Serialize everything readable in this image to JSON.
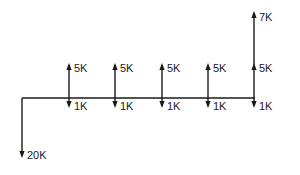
{
  "diagram": {
    "type": "cash-flow-diagram",
    "stroke_color": "#1a1a1a",
    "background": "#ffffff",
    "baseline": {
      "y": 98,
      "x_start": 22,
      "x_end": 255
    },
    "initial_outflow": {
      "x": 22,
      "label": "20K",
      "direction": "down",
      "tip_y": 158
    },
    "periods": [
      {
        "x": 69,
        "inflow": {
          "label": "5K",
          "tip_y": 63
        },
        "outflow": {
          "label": "1K",
          "tip_y": 108
        }
      },
      {
        "x": 115,
        "inflow": {
          "label": "5K",
          "tip_y": 63
        },
        "outflow": {
          "label": "1K",
          "tip_y": 108
        }
      },
      {
        "x": 162,
        "inflow": {
          "label": "5K",
          "tip_y": 63
        },
        "outflow": {
          "label": "1K",
          "tip_y": 108
        }
      },
      {
        "x": 208,
        "inflow": {
          "label": "5K",
          "tip_y": 63
        },
        "outflow": {
          "label": "1K",
          "tip_y": 108
        }
      },
      {
        "x": 254,
        "inflow": {
          "label": "5K",
          "tip_y": 63
        },
        "outflow": {
          "label": "1K",
          "tip_y": 108
        },
        "extra_inflow": {
          "label": "7K",
          "tip_y": 11
        }
      }
    ]
  }
}
